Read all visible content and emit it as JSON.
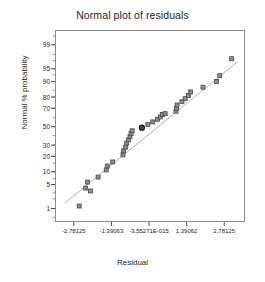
{
  "chart_data": {
    "type": "scatter",
    "title": "Normal plot of residuals",
    "xlabel": "Residual",
    "ylabel": "Normal % probability",
    "grid": false,
    "legend": "none",
    "xlim": [
      -3.4765625,
      3.4765625
    ],
    "xtick_labels": [
      "-2.78125",
      "-1.39063",
      "-3.55271E-015",
      "1.39062",
      "2.78125"
    ],
    "xtick_values": [
      -2.78125,
      -1.39063,
      0,
      1.39062,
      2.78125
    ],
    "ytick_labels": [
      "99",
      "95",
      "90",
      "80",
      "70",
      "50",
      "30",
      "20",
      "10",
      "5",
      "1"
    ],
    "ytick_values": [
      99,
      95,
      90,
      80,
      70,
      50,
      30,
      20,
      10,
      5,
      1
    ],
    "ylim": [
      0.4,
      99.7
    ],
    "reference_line": {
      "name": "normal-reference-line",
      "x": [
        -3.15,
        3.25
      ],
      "y": [
        1.6,
        97.0
      ],
      "color": "#a7a7a7"
    },
    "marker": {
      "shape": "square",
      "face_color": "#8d8d8d",
      "edge_color": "#4a4a4a",
      "size": 4
    },
    "highlight_marker": {
      "shape": "circle",
      "face_color": "#4c4c4c",
      "edge_color": "#1a1a1a",
      "size": 5
    },
    "series": [
      {
        "name": "residual-points",
        "points": [
          {
            "x": -2.62,
            "y": 1.3
          },
          {
            "x": -2.38,
            "y": 4.3
          },
          {
            "x": -2.31,
            "y": 6.1
          },
          {
            "x": -2.2,
            "y": 3.6
          },
          {
            "x": -1.92,
            "y": 8.0
          },
          {
            "x": -1.62,
            "y": 11.5
          },
          {
            "x": -1.58,
            "y": 13.8
          },
          {
            "x": -1.38,
            "y": 16.5
          },
          {
            "x": -1.0,
            "y": 22.0
          },
          {
            "x": -0.98,
            "y": 25.5
          },
          {
            "x": -0.9,
            "y": 29.0
          },
          {
            "x": -0.86,
            "y": 33.0
          },
          {
            "x": -0.8,
            "y": 36.5
          },
          {
            "x": -0.74,
            "y": 40.0
          },
          {
            "x": -0.7,
            "y": 43.5
          },
          {
            "x": -0.66,
            "y": 46.5
          },
          {
            "x": -0.3,
            "y": 50.0
          },
          {
            "x": -0.08,
            "y": 53.5
          },
          {
            "x": 0.1,
            "y": 56.5
          },
          {
            "x": 0.28,
            "y": 59.5
          },
          {
            "x": 0.38,
            "y": 62.0
          },
          {
            "x": 0.46,
            "y": 64.5
          },
          {
            "x": 0.56,
            "y": 65.5
          },
          {
            "x": 0.96,
            "y": 68.0
          },
          {
            "x": 0.98,
            "y": 71.0
          },
          {
            "x": 1.0,
            "y": 74.0
          },
          {
            "x": 1.18,
            "y": 77.0
          },
          {
            "x": 1.3,
            "y": 79.5
          },
          {
            "x": 1.42,
            "y": 82.0
          },
          {
            "x": 1.5,
            "y": 84.5
          },
          {
            "x": 1.96,
            "y": 87.5
          },
          {
            "x": 2.46,
            "y": 90.5
          },
          {
            "x": 2.58,
            "y": 93.0
          },
          {
            "x": 3.02,
            "y": 97.5
          }
        ]
      }
    ],
    "highlight_points": [
      {
        "x": -0.3,
        "y": 50.0
      }
    ]
  }
}
